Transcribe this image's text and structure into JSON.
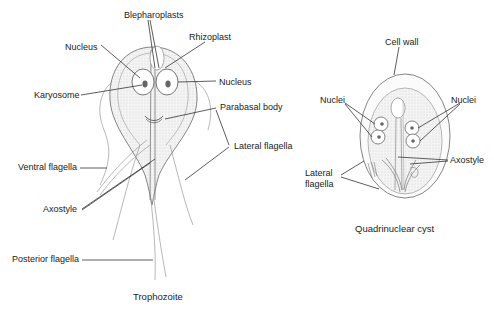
{
  "trophozoite": {
    "caption": "Trophozoite",
    "labels": {
      "blepharoplasts": "Blepharoplasts",
      "rhizoplast": "Rhizoplast",
      "nucleus_left": "Nucleus",
      "nucleus_right": "Nucleus",
      "karyosome": "Karyosome",
      "parabasal_body": "Parabasal body",
      "lateral_flagella": "Lateral flagella",
      "ventral_flagella": "Ventral flagella",
      "axostyle": "Axostyle",
      "posterior_flagella": "Posterior flagella"
    }
  },
  "cyst": {
    "caption": "Quadrinuclear cyst",
    "labels": {
      "cell_wall": "Cell wall",
      "nuclei_left": "Nuclei",
      "nuclei_right": "Nuclei",
      "axostyle": "Axostyle",
      "lateral_flagella_line1": "Lateral",
      "lateral_flagella_line2": "flagella"
    }
  },
  "colors": {
    "line": "#333333",
    "outline": "#777777",
    "stipple": "#e9e9e9",
    "karyosome": "#666666"
  }
}
